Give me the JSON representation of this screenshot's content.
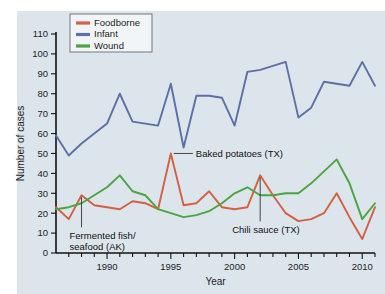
{
  "figure": {
    "background_color": "#ffffff",
    "plot_background_color": "#dde5ec"
  },
  "axes": {
    "y_title": "Number of cases",
    "x_title": "Year",
    "y_ticks": [
      "0",
      "10",
      "20",
      "30",
      "40",
      "50",
      "60",
      "70",
      "80",
      "90",
      "100",
      "110"
    ],
    "x_ticks": [
      "1990",
      "1995",
      "2000",
      "2005",
      "2010"
    ]
  },
  "legend": {
    "items": [
      {
        "label": "Foodborne",
        "color": "#d4603f"
      },
      {
        "label": "Infant",
        "color": "#5c6fa6"
      },
      {
        "label": "Wound",
        "color": "#4ba341"
      }
    ]
  },
  "annotations": [
    {
      "id": "baked-potatoes",
      "text": "Baked potatoes (TX)"
    },
    {
      "id": "fermented-fish",
      "line1": "Fermented fish/",
      "line2": "seafood (AK)"
    },
    {
      "id": "chili-sauce",
      "text": "Chili sauce (TX)"
    }
  ],
  "chart_data": {
    "type": "line",
    "title": "",
    "xlabel": "Year",
    "ylabel": "Number of cases",
    "xlim": [
      1986,
      2011
    ],
    "ylim": [
      0,
      110
    ],
    "grid": false,
    "legend_position": "top-left",
    "x": [
      1986,
      1987,
      1988,
      1989,
      1990,
      1991,
      1992,
      1993,
      1994,
      1995,
      1996,
      1997,
      1998,
      1999,
      2000,
      2001,
      2002,
      2003,
      2004,
      2005,
      2006,
      2007,
      2008,
      2009,
      2010,
      2011
    ],
    "series": [
      {
        "name": "Foodborne",
        "color": "#d4603f",
        "values": [
          23,
          17,
          29,
          24,
          23,
          22,
          26,
          25,
          22,
          50,
          24,
          25,
          31,
          23,
          22,
          23,
          39,
          29,
          20,
          16,
          17,
          20,
          30,
          18,
          7,
          23
        ]
      },
      {
        "name": "Infant",
        "color": "#5c6fa6",
        "values": [
          59,
          49,
          55,
          60,
          65,
          80,
          66,
          65,
          64,
          85,
          53,
          79,
          79,
          78,
          64,
          91,
          92,
          94,
          96,
          68,
          73,
          86,
          85,
          84,
          96,
          84
        ]
      },
      {
        "name": "Wound",
        "color": "#4ba341",
        "values": [
          22,
          23,
          25,
          29,
          33,
          39,
          31,
          29,
          22,
          20,
          18,
          19,
          21,
          25,
          30,
          33,
          29,
          29,
          30,
          30,
          35,
          41,
          47,
          35,
          17,
          25
        ]
      }
    ],
    "annotations": [
      {
        "text": "Baked potatoes (TX)",
        "points_to_year": 1995,
        "points_to_value": 50,
        "series": "Foodborne"
      },
      {
        "text": "Fermented fish/ seafood (AK)",
        "points_to_year": 1988,
        "points_to_value": 29,
        "series": "Foodborne"
      },
      {
        "text": "Chili sauce (TX)",
        "points_to_year": 2002,
        "points_to_value": 39,
        "series": "Foodborne"
      }
    ]
  }
}
